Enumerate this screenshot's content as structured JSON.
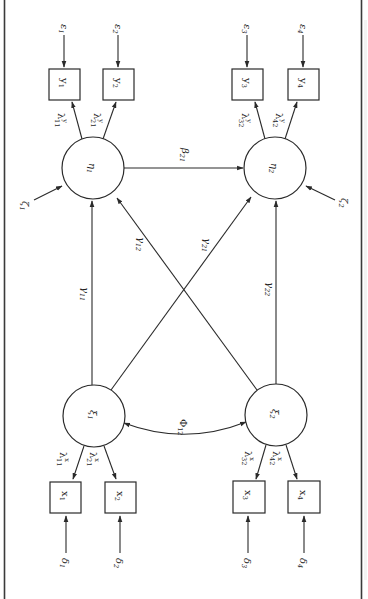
{
  "figure": {
    "orientation": "rotated-90-clockwise",
    "colors": {
      "ink": "#2a2a2a",
      "background": "#ffffff",
      "border": "#3a3a3a"
    }
  },
  "latent_endogenous": [
    {
      "id": "eta1",
      "symbol": "η",
      "sub": "1",
      "disturbance": {
        "symbol": "ζ",
        "sub": "1"
      }
    },
    {
      "id": "eta2",
      "symbol": "η",
      "sub": "2",
      "disturbance": {
        "symbol": "ζ",
        "sub": "2"
      }
    }
  ],
  "latent_exogenous": [
    {
      "id": "xi1",
      "symbol": "ξ",
      "sub": "1"
    },
    {
      "id": "xi2",
      "symbol": "ξ",
      "sub": "2"
    }
  ],
  "indicators_y": [
    {
      "id": "y1",
      "symbol": "y",
      "sub": "1",
      "error": {
        "symbol": "ε",
        "sub": "1"
      },
      "loading": {
        "symbol": "λ",
        "sup": "y",
        "sub": "11"
      }
    },
    {
      "id": "y2",
      "symbol": "y",
      "sub": "2",
      "error": {
        "symbol": "ε",
        "sub": "2"
      },
      "loading": {
        "symbol": "λ",
        "sup": "y",
        "sub": "21"
      }
    },
    {
      "id": "y3",
      "symbol": "y",
      "sub": "3",
      "error": {
        "symbol": "ε",
        "sub": "3"
      },
      "loading": {
        "symbol": "λ",
        "sup": "y",
        "sub": "32"
      }
    },
    {
      "id": "y4",
      "symbol": "y",
      "sub": "4",
      "error": {
        "symbol": "ε",
        "sub": "4"
      },
      "loading": {
        "symbol": "λ",
        "sup": "y",
        "sub": "42"
      }
    }
  ],
  "indicators_x": [
    {
      "id": "x1",
      "symbol": "x",
      "sub": "1",
      "error": {
        "symbol": "δ",
        "sub": "1"
      },
      "loading": {
        "symbol": "λ",
        "sup": "x",
        "sub": "11"
      }
    },
    {
      "id": "x2",
      "symbol": "x",
      "sub": "2",
      "error": {
        "symbol": "δ",
        "sub": "2"
      },
      "loading": {
        "symbol": "λ",
        "sup": "x",
        "sub": "21"
      }
    },
    {
      "id": "x3",
      "symbol": "x",
      "sub": "3",
      "error": {
        "symbol": "δ",
        "sub": "3"
      },
      "loading": {
        "symbol": "λ",
        "sup": "x",
        "sub": "32"
      }
    },
    {
      "id": "x4",
      "symbol": "x",
      "sub": "4",
      "error": {
        "symbol": "δ",
        "sub": "4"
      },
      "loading": {
        "symbol": "λ",
        "sup": "x",
        "sub": "42"
      }
    }
  ],
  "structural_paths": [
    {
      "id": "beta21",
      "symbol": "β",
      "sub": "21",
      "from": "eta1",
      "to": "eta2"
    },
    {
      "id": "gamma11",
      "symbol": "γ",
      "sub": "11",
      "from": "xi1",
      "to": "eta1"
    },
    {
      "id": "gamma12",
      "symbol": "γ",
      "sub": "12",
      "from": "xi2",
      "to": "eta1"
    },
    {
      "id": "gamma21",
      "symbol": "γ",
      "sub": "21",
      "from": "xi1",
      "to": "eta2"
    },
    {
      "id": "gamma22",
      "symbol": "γ",
      "sub": "22",
      "from": "xi2",
      "to": "eta2"
    }
  ],
  "covariances": [
    {
      "id": "phi12",
      "symbol": "Φ",
      "sub": "12",
      "between": [
        "xi1",
        "xi2"
      ]
    }
  ]
}
